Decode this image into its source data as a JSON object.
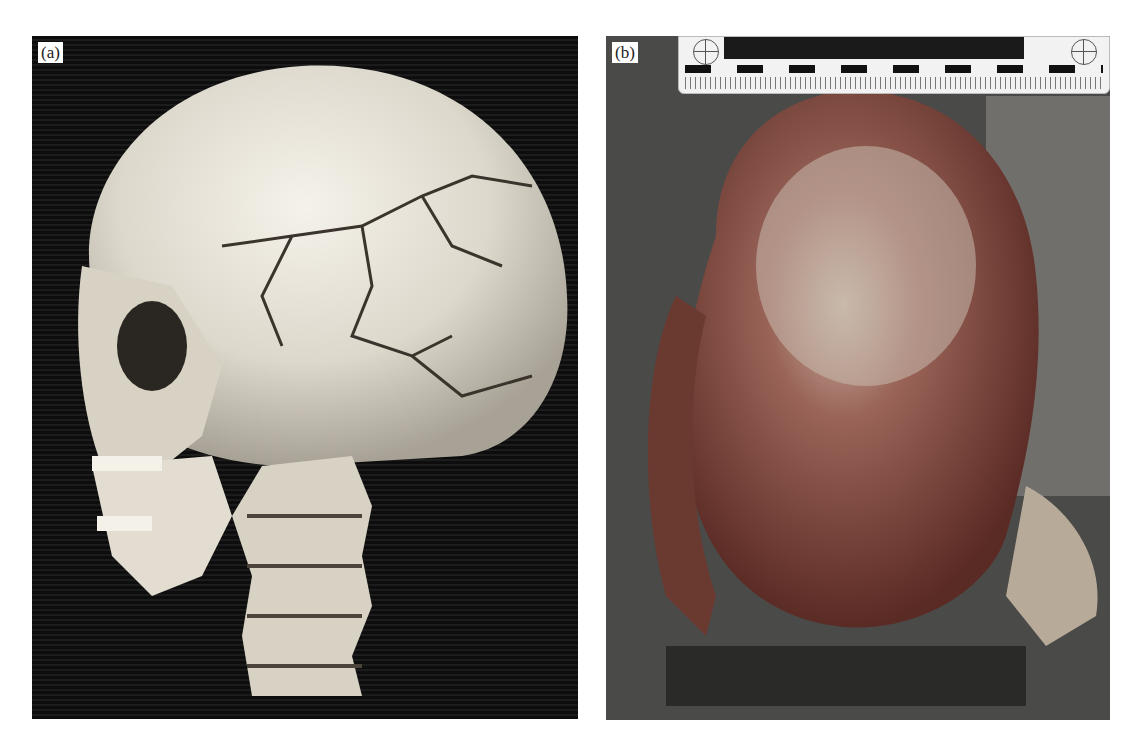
{
  "figure": {
    "panels": [
      {
        "id": "a",
        "label": "(a)",
        "description": "3D CT volume rendering of skull and cervical spine, left lateral-oblique view, showing comminuted skull fractures"
      },
      {
        "id": "b",
        "label": "(b)",
        "description": "Autopsy photograph of fractured skull with forensic scale ruler at top"
      }
    ],
    "colors": {
      "background": "#ffffff",
      "ct_background": "#111111",
      "bone": "#e8e4d8",
      "tissue": "#7a3a32",
      "ruler": "#f2f2f2"
    }
  }
}
